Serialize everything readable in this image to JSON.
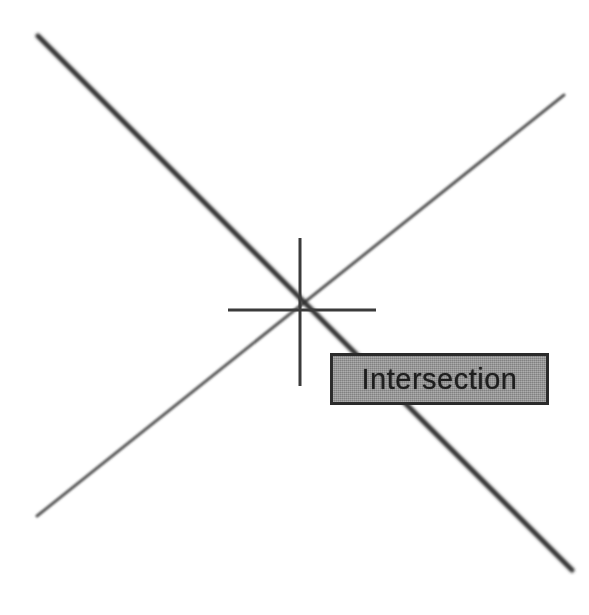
{
  "canvas": {
    "width": 589,
    "height": 615,
    "background_color": "#ffffff"
  },
  "tooltip": {
    "label": "Intersection",
    "background_color": "#8f8f8f",
    "border_color": "#2b2b2b",
    "text_color": "#1e1e1e",
    "x": 330,
    "y": 353,
    "width": 219,
    "height": 52
  },
  "snap_marker": {
    "type": "intersection-crosshair",
    "center_x": 300,
    "center_y": 310,
    "horizontal_x1": 228,
    "horizontal_x2": 376,
    "vertical_y1": 238,
    "vertical_y2": 386,
    "color": "#3a3a3a",
    "stroke_width": 3
  },
  "geometry": {
    "lines": [
      {
        "name": "thick-diagonal",
        "x1": 38,
        "y1": 36,
        "x2": 572,
        "y2": 570,
        "color": "#2e2e2e",
        "stroke_width": 5
      },
      {
        "name": "thin-diagonal",
        "x1": 37,
        "y1": 516,
        "x2": 564,
        "y2": 95,
        "color": "#555555",
        "stroke_width": 3
      }
    ]
  }
}
